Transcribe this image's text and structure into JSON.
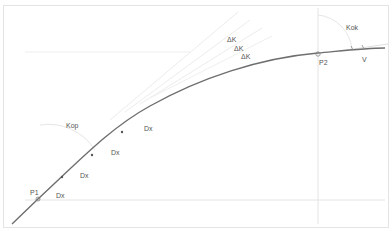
{
  "diagram": {
    "title": "",
    "colors": {
      "background": "#ffffff",
      "frame": "#e2e2e2",
      "curve": "#6e6e6e",
      "guides": "#e6e6e6",
      "tangents": "#ececec",
      "arcs": "#e4e4e4",
      "text": "#555555"
    },
    "labels": {
      "p1": "P1",
      "p2": "P2",
      "v": "V",
      "k_op": "Kop",
      "k_ok": "Kok",
      "dk_1": "ΔK",
      "dk_2": "ΔK",
      "dk_3": "ΔK",
      "dx_1": "Dx",
      "dx_2": "Dx",
      "dx_3": "Dx",
      "dx_4": "Dx"
    },
    "points": [
      {
        "id": "P1",
        "x": 38,
        "y": 199
      },
      {
        "id": "P2",
        "x": 318,
        "y": 54
      },
      {
        "id": "V",
        "x": 362,
        "y": 49
      }
    ]
  }
}
